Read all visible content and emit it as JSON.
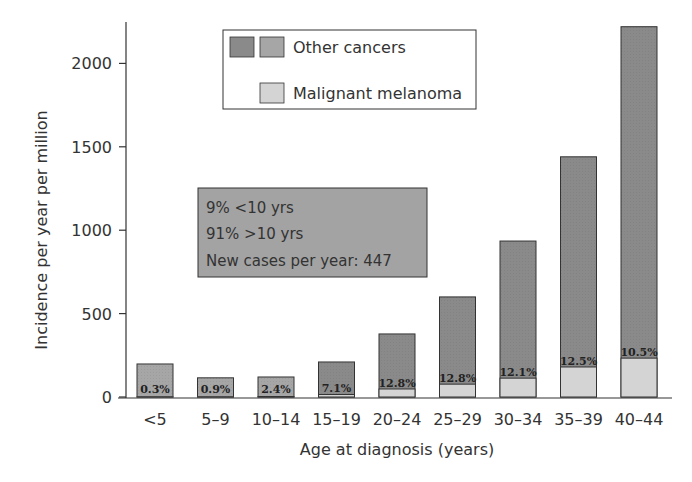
{
  "chart_data": {
    "type": "bar",
    "stacked": true,
    "title": "",
    "xlabel": "Age at diagnosis (years)",
    "ylabel": "Incidence per year per million",
    "ylim": [
      0,
      2250
    ],
    "yticks": [
      0,
      500,
      1000,
      1500,
      2000
    ],
    "grid": false,
    "legend_position": "top-center",
    "categories": [
      "<5",
      "5–9",
      "10–14",
      "15–19",
      "20–24",
      "25–29",
      "30–34",
      "35–39",
      "40–44"
    ],
    "series": [
      {
        "name": "Malignant melanoma",
        "values": [
          1,
          1,
          3,
          15,
          48,
          77,
          113,
          180,
          233
        ]
      },
      {
        "name": "Other cancers",
        "values": [
          197,
          114,
          117,
          195,
          330,
          523,
          822,
          1260,
          1987
        ]
      }
    ],
    "totals": [
      198,
      115,
      120,
      210,
      378,
      600,
      935,
      1440,
      2220
    ],
    "bar_labels": [
      "0.3%",
      "0.9%",
      "2.4%",
      "7.1%",
      "12.8%",
      "12.8%",
      "12.1%",
      "12.5%",
      "10.5%"
    ],
    "legend": [
      "Other cancers",
      "Malignant melanoma"
    ],
    "annotation": [
      "9% <10 yrs",
      "91% >10 yrs",
      "New cases per year: 447"
    ],
    "colors": {
      "other_dark": "#8a8a8a",
      "other_light": "#a6a6a6",
      "melanoma": "#d4d4d4",
      "annotation_bg": "#a3a3a3",
      "axis": "#333333"
    }
  }
}
